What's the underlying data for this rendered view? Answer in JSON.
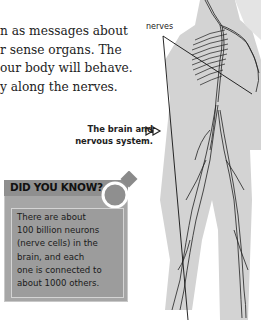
{
  "body_text": {
    "lines": [
      "n as messages about",
      "r sense organs. The",
      "our body will behave.",
      "y along the nerves."
    ]
  },
  "figure": {
    "label": "nerves",
    "caption_line1": "The brain and",
    "caption_line2": "nervous system.",
    "caption_arrow_icon": "double-triangle-arrow-icon"
  },
  "did_you_know": {
    "title": "DID YOU KNOW?",
    "lines": [
      "There are about",
      "100 billion neurons",
      "(nerve cells) in the",
      "brain, and each",
      "one is connected to",
      "about 1000 others."
    ],
    "box_color": "#a6a6a6",
    "header_color": "#8f8f8f"
  }
}
